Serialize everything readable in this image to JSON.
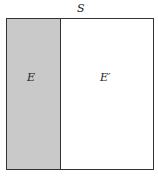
{
  "diagram": {
    "type": "venn-complement",
    "sample_space_label": "S",
    "event_label": "E",
    "complement_label": "E′",
    "colors": {
      "event_fill": "#c9c9c9",
      "complement_fill": "#ffffff",
      "border": "#333333"
    }
  }
}
